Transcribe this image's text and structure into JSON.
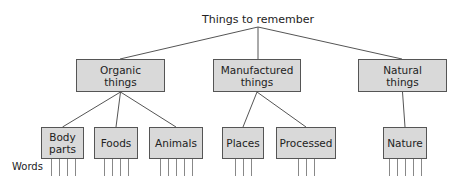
{
  "diagram": {
    "root": {
      "label": "Things to remember",
      "x": 258,
      "y": 13
    },
    "words_label": "Words",
    "colors": {
      "box_fill": "#d9d9d9",
      "box_border": "#555555",
      "line": "#555555",
      "word_line": "#888888"
    },
    "categories": [
      {
        "id": "organic",
        "line1": "Organic",
        "line2": "things",
        "x": 76,
        "y": 59,
        "w": 89,
        "h": 33,
        "top_x": 120,
        "children": [
          {
            "id": "body-parts",
            "line1": "Body",
            "line2": "parts",
            "x": 41,
            "y": 127,
            "w": 43,
            "h": 32,
            "words": 4
          },
          {
            "id": "foods",
            "line1": "Foods",
            "line2": "",
            "x": 94,
            "y": 127,
            "w": 44,
            "h": 32,
            "words": 4
          },
          {
            "id": "animals",
            "line1": "Animals",
            "line2": "",
            "x": 149,
            "y": 127,
            "w": 54,
            "h": 32,
            "words": 5
          }
        ]
      },
      {
        "id": "manufactured",
        "line1": "Manufactured",
        "line2": "things",
        "x": 213,
        "y": 59,
        "w": 88,
        "h": 33,
        "top_x": 258,
        "children": [
          {
            "id": "places",
            "line1": "Places",
            "line2": "",
            "x": 222,
            "y": 127,
            "w": 42,
            "h": 32,
            "words": 3
          },
          {
            "id": "processed",
            "line1": "Processed",
            "line2": "",
            "x": 276,
            "y": 127,
            "w": 60,
            "h": 32,
            "words": 3
          }
        ]
      },
      {
        "id": "natural",
        "line1": "Natural",
        "line2": "things",
        "x": 358,
        "y": 59,
        "w": 89,
        "h": 33,
        "top_x": 402,
        "children": [
          {
            "id": "nature",
            "line1": "Nature",
            "line2": "",
            "x": 383,
            "y": 127,
            "w": 44,
            "h": 32,
            "words": 5
          }
        ]
      }
    ]
  }
}
